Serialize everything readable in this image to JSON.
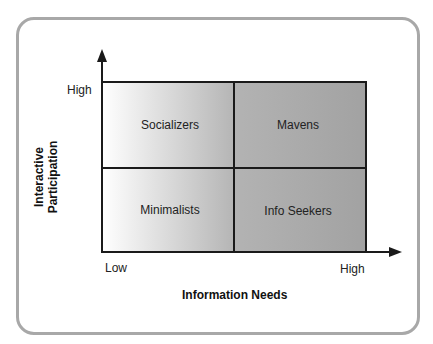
{
  "diagram": {
    "type": "2x2 matrix",
    "x_axis": {
      "title": "Information Needs",
      "low_label": "Low",
      "high_label": "High"
    },
    "y_axis": {
      "title_line1": "Interactive",
      "title_line2": "Participation",
      "high_label": "High"
    },
    "quadrants": {
      "top_left": "Socializers",
      "top_right": "Mavens",
      "bottom_left": "Minimalists",
      "bottom_right": "Info Seekers"
    },
    "colors": {
      "frame": "#a8a8a8",
      "grid_line": "#1a1a1a",
      "fill_light": "#ffffff",
      "fill_dark": "#a9a9a9"
    }
  }
}
